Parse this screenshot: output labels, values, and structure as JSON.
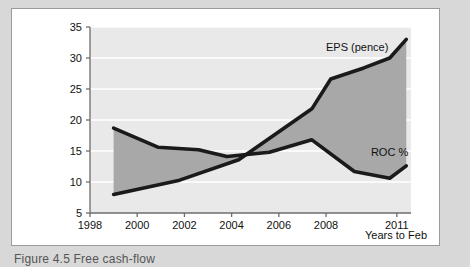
{
  "figure": {
    "caption": "Figure 4.5 Free cash-flow",
    "axis_x_title": "Years to Feb"
  },
  "chart_data": {
    "type": "line",
    "title": "",
    "xlabel": "Years to Feb",
    "ylabel": "",
    "xlim": [
      1998,
      2011.6
    ],
    "ylim": [
      5,
      35
    ],
    "yticks": [
      5,
      10,
      15,
      20,
      25,
      30,
      35
    ],
    "xticks": [
      1998,
      2000,
      2002,
      2004,
      2006,
      2008,
      2011
    ],
    "grid": "horizontal",
    "legend_position": "inline-annotation",
    "shaded_band_between_series": true,
    "series": [
      {
        "name": "EPS (pence)",
        "color": "#1a1a1a",
        "x": [
          1999.0,
          2001.8,
          2004.3,
          2007.4,
          2008.2,
          2009.6,
          2010.7,
          2011.4
        ],
        "values": [
          8.0,
          10.3,
          13.6,
          21.8,
          26.6,
          28.4,
          30.0,
          33.0
        ]
      },
      {
        "name": "ROC %",
        "color": "#1a1a1a",
        "x": [
          1999.0,
          2000.9,
          2002.6,
          2003.8,
          2005.6,
          2007.4,
          2009.2,
          2010.7,
          2011.4
        ],
        "values": [
          18.7,
          15.6,
          15.2,
          14.1,
          14.8,
          16.8,
          11.7,
          10.6,
          12.6
        ]
      }
    ],
    "annotations": [
      {
        "text": "EPS (pence)",
        "x": 2008.0,
        "y": 31.6
      },
      {
        "text": "ROC %",
        "x": 2009.9,
        "y": 14.6
      }
    ],
    "colors": {
      "plot_background": "#e9e9e9",
      "band_fill": "#a8a8a8",
      "gridline": "#ffffff",
      "line": "#1a1a1a",
      "axis": "#6d6d6d",
      "card": "#ffffff",
      "page": "#d8d8d8"
    }
  }
}
